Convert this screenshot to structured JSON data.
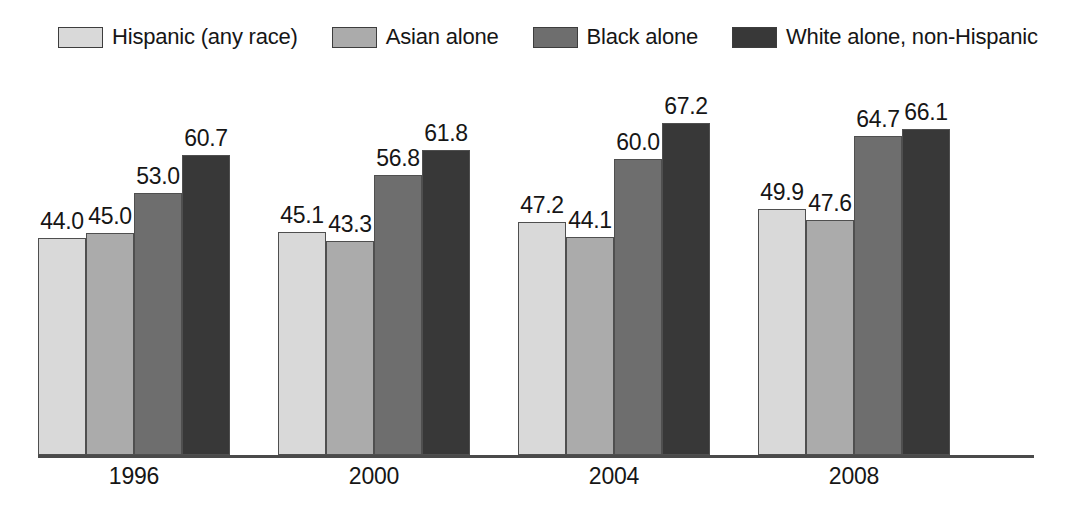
{
  "legend": {
    "items": [
      {
        "label": "Hispanic (any race)",
        "color": "#d9d9d9",
        "icon": "legend-swatch-icon"
      },
      {
        "label": "Asian alone",
        "color": "#ababab",
        "icon": "legend-swatch-icon"
      },
      {
        "label": "Black alone",
        "color": "#6e6e6e",
        "icon": "legend-swatch-icon"
      },
      {
        "label": "White alone, non-Hispanic",
        "color": "#383838",
        "icon": "legend-swatch-icon"
      }
    ]
  },
  "chart_data": {
    "type": "bar",
    "title": "",
    "subtitle": "",
    "xlabel": "",
    "ylabel": "",
    "categories": [
      "1996",
      "2000",
      "2004",
      "2008"
    ],
    "series": [
      {
        "name": "Hispanic (any race)",
        "color": "#d9d9d9",
        "values": [
          44.0,
          45.1,
          47.2,
          49.9
        ]
      },
      {
        "name": "Asian alone",
        "color": "#ababab",
        "values": [
          45.0,
          43.3,
          44.1,
          47.6
        ]
      },
      {
        "name": "Black alone",
        "color": "#6e6e6e",
        "values": [
          53.0,
          56.8,
          60.0,
          64.7
        ]
      },
      {
        "name": "White alone, non-Hispanic",
        "color": "#383838",
        "values": [
          60.7,
          61.8,
          67.2,
          66.1
        ]
      }
    ],
    "value_labels": [
      [
        "44.0",
        "45.0",
        "53.0",
        "60.7"
      ],
      [
        "45.1",
        "43.3",
        "56.8",
        "61.8"
      ],
      [
        "47.2",
        "44.1",
        "60.0",
        "67.2"
      ],
      [
        "49.9",
        "47.6",
        "64.7",
        "66.1"
      ]
    ],
    "ylim": [
      0,
      78
    ],
    "grid": false,
    "legend_position": "top",
    "axis_color": "#4a4a4a"
  }
}
